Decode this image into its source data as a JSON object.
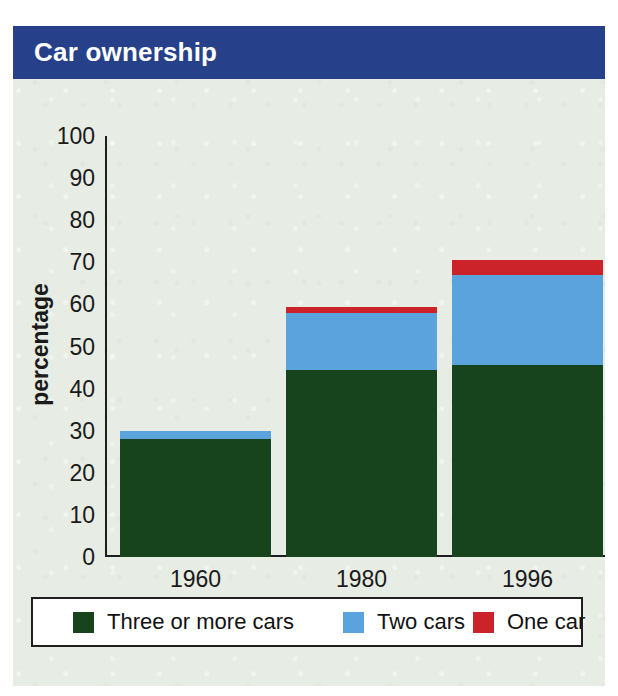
{
  "figure": {
    "title": "Car ownership",
    "caption": "Households with regular use of car(s)"
  },
  "colors": {
    "banner": "#26418a",
    "background": "#e7ece4",
    "three_or_more": "#17441c",
    "two_cars": "#5ba3dd",
    "one_car": "#cc2229",
    "axis": "#1e1e1e",
    "legend_background": "#ffffff",
    "legend_border": "#20201f"
  },
  "chart_data": {
    "type": "bar",
    "stacked": true,
    "title": "Car ownership",
    "subtitle": "Households with regular use of car(s)",
    "xlabel": "",
    "ylabel": "percentage",
    "ylim": [
      0,
      100
    ],
    "ytick_step": 10,
    "yticks": [
      "100",
      "90",
      "80",
      "70",
      "60",
      "50",
      "40",
      "30",
      "20",
      "10",
      "0"
    ],
    "grid": false,
    "legend_position": "bottom",
    "categories": [
      "1960",
      "1980",
      "1996"
    ],
    "series": [
      {
        "name": "Three or more cars",
        "color": "#17441c",
        "values": [
          28,
          44.5,
          45.5
        ]
      },
      {
        "name": "Two cars",
        "color": "#5ba3dd",
        "values": [
          2,
          13.5,
          21.5
        ]
      },
      {
        "name": "One car",
        "color": "#cc2229",
        "values": [
          0,
          1.5,
          3.5
        ]
      }
    ],
    "totals": [
      30,
      59.5,
      70.5
    ]
  },
  "legend": {
    "items": [
      {
        "label": "Three or more cars",
        "color": "#17441c"
      },
      {
        "label": "Two cars",
        "color": "#5ba3dd"
      },
      {
        "label": "One car",
        "color": "#cc2229"
      }
    ]
  }
}
